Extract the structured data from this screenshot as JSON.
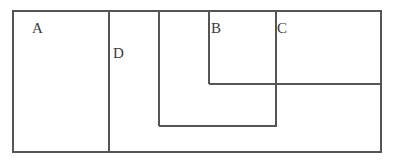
{
  "figure": {
    "type": "line-diagram",
    "background_color": "#ffffff",
    "stroke_color": "#555555",
    "label_color": "#3a3a3a",
    "stroke_width": 1.3,
    "canvas": {
      "width": 395,
      "height": 162
    }
  },
  "labels": [
    {
      "id": "label-a",
      "text": "A",
      "x": 32,
      "y": 21
    },
    {
      "id": "label-d",
      "text": "D",
      "x": 113,
      "y": 46
    },
    {
      "id": "label-b",
      "text": "B",
      "x": 211,
      "y": 21
    },
    {
      "id": "label-c",
      "text": "C",
      "x": 277,
      "y": 21
    }
  ],
  "geometry": {
    "outer_rect": {
      "x1": 13,
      "y1": 11,
      "x2": 381,
      "y2": 152
    },
    "lines": [
      {
        "id": "divider-a-d",
        "orientation": "vertical",
        "x": 109,
        "y1": 11,
        "y2": 152
      },
      {
        "id": "divider-d-inner",
        "orientation": "vertical",
        "x": 159,
        "y1": 11,
        "y2": 126
      },
      {
        "id": "divider-b-left",
        "orientation": "vertical",
        "x": 209,
        "y1": 11,
        "y2": 84
      },
      {
        "id": "divider-c-left",
        "orientation": "vertical",
        "x": 276,
        "y1": 11,
        "y2": 126
      },
      {
        "id": "divider-b-bottom",
        "orientation": "horizontal",
        "y": 84,
        "x1": 209,
        "x2": 381
      },
      {
        "id": "divider-inner-bottom",
        "orientation": "horizontal",
        "y": 126,
        "x1": 159,
        "x2": 276
      }
    ]
  }
}
